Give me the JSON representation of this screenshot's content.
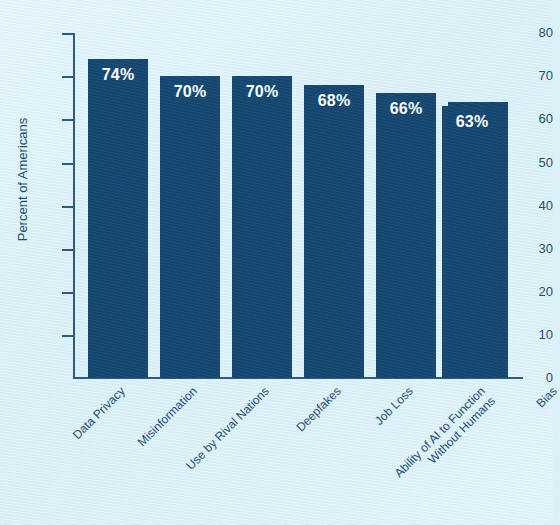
{
  "chart_data": {
    "type": "bar",
    "title": "",
    "subtitle": "",
    "xlabel": "",
    "ylabel": "Percent of Americans",
    "ylim": [
      0,
      80
    ],
    "yticks": [
      0,
      10,
      20,
      30,
      40,
      50,
      60,
      70,
      80
    ],
    "ytick_labels": [
      "0",
      "10",
      "20",
      "30",
      "40",
      "50",
      "60",
      "70",
      "80"
    ],
    "grid": false,
    "legend": false,
    "legend_position": "none",
    "orientation": "vertical",
    "categories": [
      "Data Privacy",
      "Misinformation",
      "Use by Rival Nations",
      "Deepfakes",
      "Job Loss",
      "Ability of AI to Function\nWithout Humans",
      "Bias"
    ],
    "values": [
      74,
      70,
      70,
      68,
      66,
      64,
      63
    ],
    "value_labels": [
      "74%",
      "70%",
      "70%",
      "68%",
      "66%",
      "64%",
      "63%"
    ],
    "colors": {
      "bar": "#154872",
      "background": "#dcf0f7",
      "axis": "#2b5d82",
      "axis_text": "#1d4e77",
      "value_label_text": "#ffffff"
    }
  }
}
